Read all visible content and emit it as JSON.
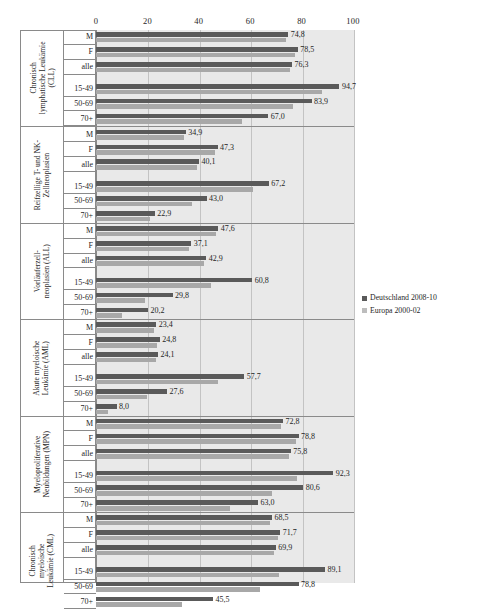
{
  "legend": {
    "position": "right-middle",
    "entries": [
      {
        "label": "Deutschland 2008-10",
        "color": "#5a5a5a",
        "key": "de"
      },
      {
        "label": "Europa 2000-02",
        "color": "#bdbdbd",
        "key": "eu"
      }
    ]
  },
  "axis": {
    "ticks": [
      "0",
      "20",
      "40",
      "60",
      "80",
      "100"
    ],
    "min": 0,
    "max": 100
  },
  "chart_data": {
    "type": "bar",
    "orientation": "horizontal",
    "title": "",
    "xlabel": "",
    "ylabel": "",
    "xlim": [
      0,
      100
    ],
    "grid": true,
    "legend_position": "right",
    "series": [
      {
        "name": "Deutschland 2008-10",
        "color": "#5a5a5a"
      },
      {
        "name": "Europa 2000-02",
        "color": "#a8a8a8"
      }
    ],
    "groups": [
      {
        "label": "Chronisch lymphatische Leukämie (CLL)",
        "label_lines": [
          "Chronisch",
          "lymphatische Leukämie",
          "(CLL)"
        ],
        "rows": [
          {
            "category": "M",
            "de": 74.8,
            "eu": 74.0,
            "de_text": "74,8"
          },
          {
            "category": "F",
            "de": 78.5,
            "eu": 77.6,
            "de_text": "78,5"
          },
          {
            "category": "alle",
            "de": 76.3,
            "eu": 75.4,
            "de_text": "76,3"
          },
          {
            "category": "15-49",
            "de": 94.7,
            "eu": 88.0,
            "de_text": "94,7"
          },
          {
            "category": "50-69",
            "de": 83.9,
            "eu": 76.6,
            "de_text": "83,9"
          },
          {
            "category": "70+",
            "de": 67.0,
            "eu": 56.8,
            "de_text": "67,0"
          }
        ]
      },
      {
        "label": "Reifzellige T- und NK- Zellneoplasien",
        "label_lines": [
          "Reifzellige T- und NK-",
          "Zellneoplasien"
        ],
        "rows": [
          {
            "category": "M",
            "de": 34.9,
            "eu": 34.2,
            "de_text": "34,9"
          },
          {
            "category": "F",
            "de": 47.3,
            "eu": 46.4,
            "de_text": "47,3"
          },
          {
            "category": "alle",
            "de": 40.1,
            "eu": 39.4,
            "de_text": "40,1"
          },
          {
            "category": "15-49",
            "de": 67.2,
            "eu": 61.0,
            "de_text": "67,2"
          },
          {
            "category": "50-69",
            "de": 43.0,
            "eu": 37.4,
            "de_text": "43,0"
          },
          {
            "category": "70+",
            "de": 22.9,
            "eu": 21.2,
            "de_text": "22,9"
          }
        ]
      },
      {
        "label": "Vorläuferzell-neoplasien (ALL)",
        "label_lines": [
          "Vorläuferzell-",
          "neoplasien (ALL)"
        ],
        "rows": [
          {
            "category": "M",
            "de": 47.6,
            "eu": 46.8,
            "de_text": "47,6"
          },
          {
            "category": "F",
            "de": 37.1,
            "eu": 36.3,
            "de_text": "37,1"
          },
          {
            "category": "alle",
            "de": 42.9,
            "eu": 42.1,
            "de_text": "42,9"
          },
          {
            "category": "15-49",
            "de": 60.8,
            "eu": 44.8,
            "de_text": "60,8"
          },
          {
            "category": "50-69",
            "de": 29.8,
            "eu": 19.0,
            "de_text": "29,8"
          },
          {
            "category": "70+",
            "de": 20.2,
            "eu": 10.2,
            "de_text": "20,2"
          }
        ]
      },
      {
        "label": "Akute myeloische Leukämie (AML)",
        "label_lines": [
          "Akute myeloische",
          "Leukämie (AML)"
        ],
        "rows": [
          {
            "category": "M",
            "de": 23.4,
            "eu": 22.6,
            "de_text": "23,4"
          },
          {
            "category": "F",
            "de": 24.8,
            "eu": 23.9,
            "de_text": "24,8"
          },
          {
            "category": "alle",
            "de": 24.1,
            "eu": 23.3,
            "de_text": "24,1"
          },
          {
            "category": "15-49",
            "de": 57.7,
            "eu": 47.3,
            "de_text": "57,7"
          },
          {
            "category": "50-69",
            "de": 27.6,
            "eu": 19.7,
            "de_text": "27,6"
          },
          {
            "category": "70+",
            "de": 8.0,
            "eu": 4.6,
            "de_text": "8,0"
          }
        ]
      },
      {
        "label": "Myeloproliferative Neubildungen (MPN)",
        "label_lines": [
          "Myeloproliferative",
          "Neubildungen (MPN)"
        ],
        "rows": [
          {
            "category": "M",
            "de": 72.8,
            "eu": 72.0,
            "de_text": "72,8"
          },
          {
            "category": "F",
            "de": 78.8,
            "eu": 78.0,
            "de_text": "78,8"
          },
          {
            "category": "alle",
            "de": 75.8,
            "eu": 75.0,
            "de_text": "75,8"
          },
          {
            "category": "15-49",
            "de": 92.3,
            "eu": 78.2,
            "de_text": "92,3"
          },
          {
            "category": "50-69",
            "de": 80.6,
            "eu": 68.6,
            "de_text": "80,6"
          },
          {
            "category": "70+",
            "de": 63.0,
            "eu": 52.0,
            "de_text": "63,0"
          }
        ]
      },
      {
        "label": "Chronisch myeloische Leukämie (CML)",
        "label_lines": [
          "Chronisch",
          "myeloische",
          "Leukämie (CML)"
        ],
        "rows": [
          {
            "category": "M",
            "de": 68.5,
            "eu": 67.7,
            "de_text": "68,5"
          },
          {
            "category": "F",
            "de": 71.7,
            "eu": 70.9,
            "de_text": "71,7"
          },
          {
            "category": "alle",
            "de": 69.9,
            "eu": 69.1,
            "de_text": "69,9"
          },
          {
            "category": "15-49",
            "de": 89.1,
            "eu": 71.4,
            "de_text": "89,1"
          },
          {
            "category": "50-69",
            "de": 78.8,
            "eu": 63.8,
            "de_text": "78,8"
          },
          {
            "category": "70+",
            "de": 45.5,
            "eu": 33.4,
            "de_text": "45,5"
          }
        ]
      }
    ]
  }
}
